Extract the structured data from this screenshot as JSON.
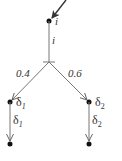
{
  "diagram": {
    "type": "probabilistic-transition-tree",
    "colors": {
      "edge": "#777777",
      "node": "#111111",
      "text": "#333333",
      "background": "#ffffff"
    },
    "root": {
      "label": "i",
      "incoming_arrow": true
    },
    "trunk": {
      "label": "i"
    },
    "branches": [
      {
        "probability": "0.4",
        "target_label": "δ",
        "target_sub": "1",
        "edge_label": "δ",
        "edge_sub": "1"
      },
      {
        "probability": "0.6",
        "target_label": "δ",
        "target_sub": "2",
        "edge_label": "δ",
        "edge_sub": "2"
      }
    ]
  }
}
